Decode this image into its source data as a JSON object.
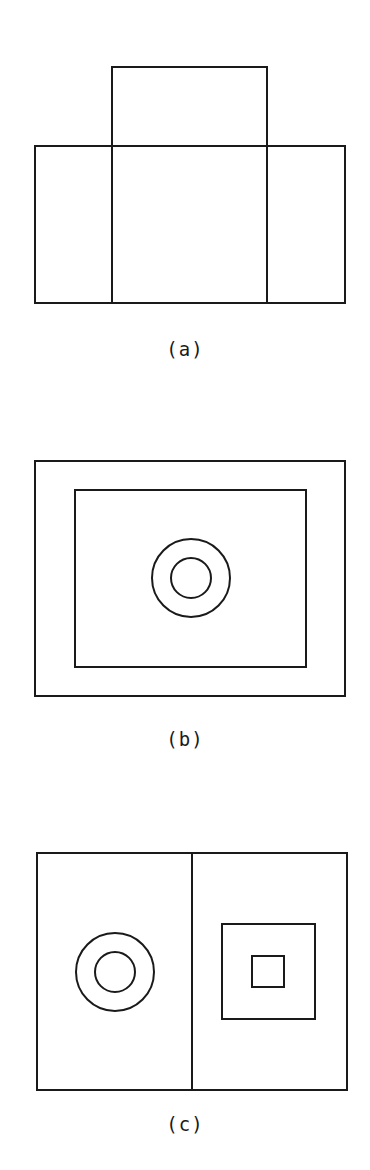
{
  "figures": [
    {
      "id": "a",
      "label": "(a)",
      "description": "Cross-shaped unfolded box outline: a top square above a wide rectangle split into three panels",
      "shapes": {
        "top_box": {
          "x": 112,
          "y": 67,
          "w": 155,
          "h": 79
        },
        "main_rect": {
          "x": 35,
          "y": 146,
          "w": 310,
          "h": 157
        },
        "dividers_x": [
          112,
          267
        ]
      }
    },
    {
      "id": "b",
      "label": "(b)",
      "description": "Nested rectangles with concentric circles at center",
      "shapes": {
        "outer_rect": {
          "x": 35,
          "y": 461,
          "w": 310,
          "h": 235
        },
        "inner_rect": {
          "x": 75,
          "y": 490,
          "w": 231,
          "h": 177
        },
        "circles": [
          {
            "cx": 191,
            "cy": 578,
            "r": 39
          },
          {
            "cx": 191,
            "cy": 578,
            "r": 20
          }
        ]
      }
    },
    {
      "id": "c",
      "label": "(c)",
      "description": "Rectangle split into two halves: concentric circles on left, nested squares on right",
      "shapes": {
        "outer_rect": {
          "x": 37,
          "y": 853,
          "w": 310,
          "h": 237
        },
        "divider_x": 192,
        "circles": [
          {
            "cx": 115,
            "cy": 972,
            "r": 39
          },
          {
            "cx": 115,
            "cy": 972,
            "r": 20
          }
        ],
        "outer_square": {
          "x": 222,
          "y": 924,
          "w": 93,
          "h": 95
        },
        "inner_square": {
          "x": 252,
          "y": 956,
          "w": 32,
          "h": 31
        }
      }
    }
  ],
  "colors": {
    "stroke": "#1a1a1a",
    "background": "#ffffff"
  }
}
